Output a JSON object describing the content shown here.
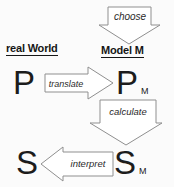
{
  "diagram": {
    "headers": {
      "real_world": "real World",
      "model_m": "Model M"
    },
    "nodes": {
      "p": "P",
      "pm": {
        "base": "P",
        "sub": "M"
      },
      "s": "S",
      "sm": {
        "base": "S",
        "sub": "M"
      }
    },
    "arrows": {
      "choose": {
        "label": "choose",
        "direction": "down",
        "from": "real World",
        "to": "Model M"
      },
      "translate": {
        "label": "translate",
        "direction": "right",
        "from": "P",
        "to": "PM"
      },
      "calculate": {
        "label": "calculate",
        "direction": "down",
        "from": "PM",
        "to": "SM"
      },
      "interpret": {
        "label": "interpret",
        "direction": "left",
        "from": "SM",
        "to": "S"
      }
    },
    "colors": {
      "background": "#fbfbfb",
      "arrow_fill": "#ffffff",
      "arrow_outline": "#8f8f8f",
      "text": "#1c1c1c"
    }
  }
}
